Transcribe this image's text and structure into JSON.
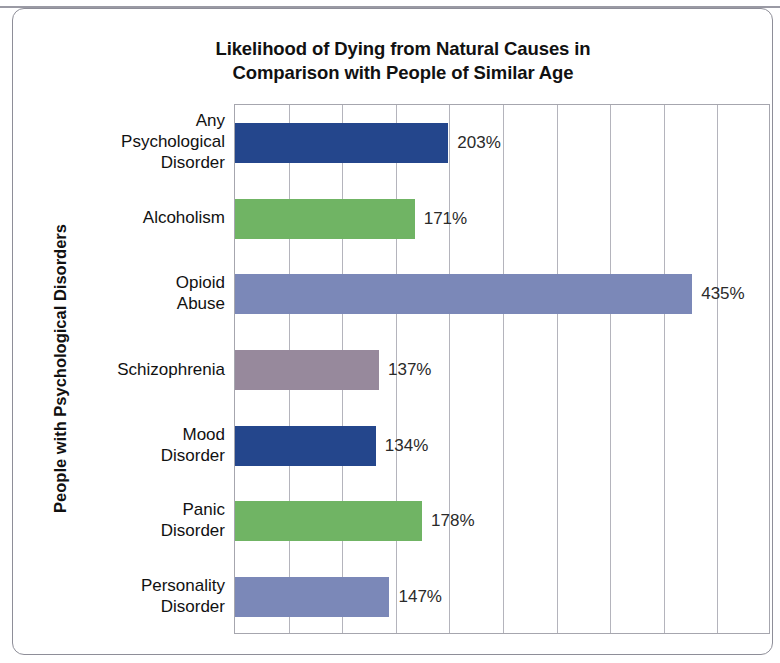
{
  "chart_data": {
    "type": "bar",
    "orientation": "horizontal",
    "title": "Likelihood of Dying from Natural Causes in Comparison with People of Similar Age",
    "title_lines": [
      "Likelihood of Dying from Natural Causes in",
      "Comparison with People of Similar Age"
    ],
    "xlabel": "",
    "ylabel": "People with Psychological Disorders",
    "categories": [
      "Any Psychological Disorder",
      "Alcoholism",
      "Opioid Abuse",
      "Schizophrenia",
      "Mood Disorder",
      "Panic Disorder",
      "Personality Disorder"
    ],
    "category_lines": [
      [
        "Any",
        "Psychological",
        "Disorder"
      ],
      [
        "Alcoholism"
      ],
      [
        "Opioid",
        "Abuse"
      ],
      [
        "Schizophrenia"
      ],
      [
        "Mood",
        "Disorder"
      ],
      [
        "Panic",
        "Disorder"
      ],
      [
        "Personality",
        "Disorder"
      ]
    ],
    "values": [
      203,
      171,
      435,
      137,
      134,
      178,
      147
    ],
    "value_labels": [
      "203%",
      "171%",
      "435%",
      "137%",
      "134%",
      "178%",
      "147%"
    ],
    "bar_colors": [
      "#24468c",
      "#70b464",
      "#7b88b8",
      "#97899c",
      "#24468c",
      "#70b464",
      "#7b88b8"
    ],
    "xlim": [
      0,
      510
    ],
    "gridline_count": 9,
    "grid": true,
    "legend": false,
    "axis_tick_labels": []
  },
  "frame": {
    "border_color": "#8e8e98",
    "rule_color": "#9a9aa4"
  },
  "plot": {
    "border_color": "#a6a6ae",
    "gridline_color": "#b4b4bc",
    "background": "#ffffff"
  }
}
